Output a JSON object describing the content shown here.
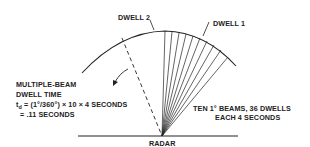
{
  "diagram": {
    "labels": {
      "dwell2": "DWELL 2",
      "dwell1": "DWELL 1",
      "radar": "RADAR",
      "left_block": {
        "line1": "MULTIPLE-BEAM",
        "line2": "DWELL TIME",
        "line3_prefix": "t",
        "line3_sub": "d",
        "line3_rest": " = (1°/360°) × 10 × 4 SECONDS",
        "line4": "= .11 SECONDS"
      },
      "right_block": {
        "line1": "TEN 1° BEAMS, 36 DWELLS",
        "line2": "EACH 4 SECONDS"
      }
    },
    "colors": {
      "line": "#222222",
      "background": "#ffffff"
    },
    "beam_count": 10
  }
}
